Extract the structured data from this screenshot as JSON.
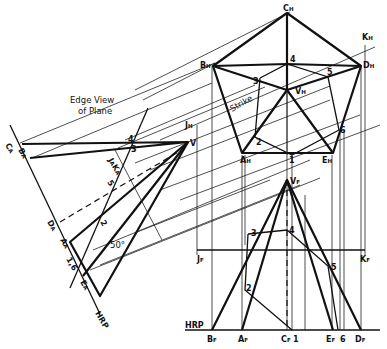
{
  "annotations": {
    "edge_view_line1": "Edge View",
    "edge_view_line2": "of Plane",
    "strike": "Strike",
    "strike_bearing": "N 50° E",
    "angle_aux": "50°",
    "hrp_aux": "HRP",
    "hrp_front": "HRP"
  },
  "top_view_labels": {
    "C": "C",
    "B": "B",
    "D": "D",
    "A": "A",
    "E": "E",
    "K": "K",
    "J": "J",
    "V": "V",
    "sub": "H",
    "pts": [
      "1",
      "2",
      "3",
      "4",
      "5",
      "6"
    ]
  },
  "front_view_labels": {
    "B": "B",
    "A": "A",
    "C": "C",
    "E": "E",
    "D": "D",
    "J": "J",
    "K": "K",
    "V": "V",
    "sub": "F",
    "pts": [
      "1",
      "2",
      "3",
      "4",
      "5",
      "6"
    ]
  },
  "aux_view_labels": {
    "CB": "C",
    "CB2": "B",
    "D": "D",
    "A": "A",
    "E": "E",
    "JK": "J",
    "JK2": "K",
    "V": "V",
    "sub": "A",
    "pts": [
      "1,6",
      "2",
      "3",
      "4",
      "5"
    ]
  }
}
